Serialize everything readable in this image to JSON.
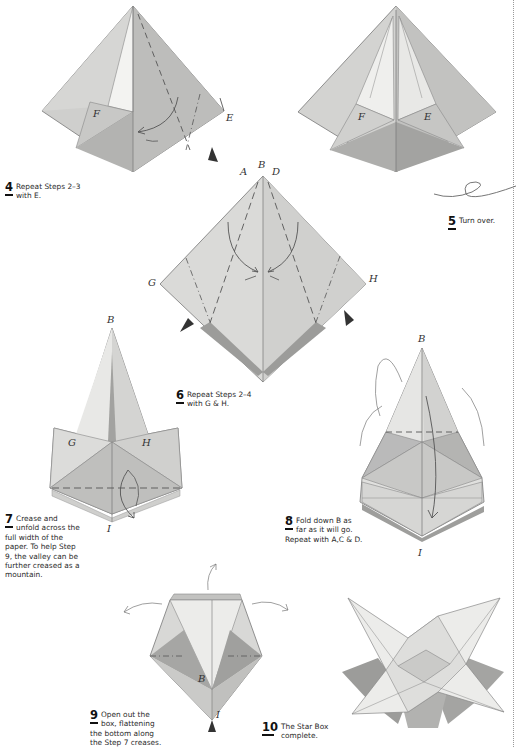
{
  "page": {
    "type": "origami instruction sheet",
    "accent_color": "#111111",
    "paper_shades": [
      "#f2f2f0",
      "#dcdcda",
      "#c4c4c2",
      "#a9a9a7",
      "#8d8d8b"
    ]
  },
  "steps": [
    {
      "number": "4",
      "text": "Repeat Steps 2–3 with E.",
      "lines": [
        "Repeat Steps 2–3",
        "with E."
      ],
      "diagram_labels": [
        "F",
        "E"
      ]
    },
    {
      "number": "5",
      "text": "Turn over.",
      "lines": [
        "Turn over."
      ],
      "diagram_labels": [
        "F",
        "E"
      ]
    },
    {
      "number": "6",
      "text": "Repeat Steps 2–4 with G & H.",
      "lines": [
        "Repeat Steps 2–4",
        "with G & H."
      ],
      "diagram_labels": [
        "A",
        "B",
        "D",
        "G",
        "H"
      ]
    },
    {
      "number": "7",
      "text": "Crease and unfold across the full width of the paper. To help Step 9, the valley can be further creased as a mountain.",
      "lines": [
        "Crease and",
        "unfold across the",
        "full width of the",
        "paper. To help Step",
        "9, the valley can be",
        "further creased as a",
        "mountain."
      ],
      "diagram_labels": [
        "B",
        "G",
        "H",
        "I"
      ]
    },
    {
      "number": "8",
      "text": "Fold down B as far as it will go. Repeat with A,C & D.",
      "lines": [
        "Fold down B as",
        "far as it will go.",
        "Repeat with A,C & D."
      ],
      "diagram_labels": [
        "B",
        "I"
      ]
    },
    {
      "number": "9",
      "text": "Open out the box, flattening the bottom along the Step 7 creases.",
      "lines": [
        "Open out the",
        "box, flattening",
        "the bottom along",
        "the Step 7 creases."
      ],
      "diagram_labels": [
        "B",
        "I"
      ]
    },
    {
      "number": "10",
      "text": "The Star Box complete.",
      "lines": [
        "The Star Box",
        "complete."
      ],
      "diagram_labels": []
    }
  ],
  "icons": {
    "turn_over": "looped-arrow-icon",
    "fold_direction": "curved-arrow-icon",
    "pressure_point": "black-triangle-arrow-icon"
  }
}
